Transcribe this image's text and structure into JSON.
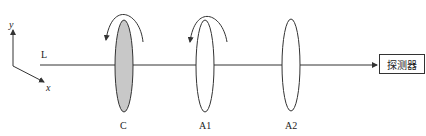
{
  "axes": {
    "y_label": "y",
    "x_label": "x"
  },
  "beam_label": "L",
  "elements": [
    {
      "id": "C",
      "label": "C",
      "filled": true,
      "rotating": true
    },
    {
      "id": "A1",
      "label": "A1",
      "filled": false,
      "rotating": true
    },
    {
      "id": "A2",
      "label": "A2",
      "filled": false,
      "rotating": false
    }
  ],
  "detector": {
    "label": "探测器"
  },
  "colors": {
    "line": "#333333",
    "fill": "#c8c8c8"
  }
}
